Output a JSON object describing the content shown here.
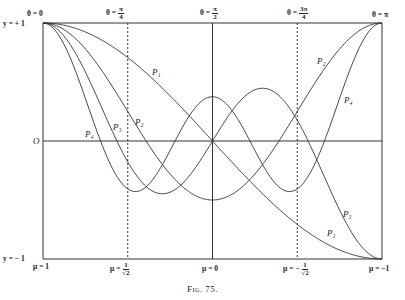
{
  "figure": {
    "caption": "Fig. 75."
  },
  "labels": {
    "theta_0": "θ = 0",
    "theta_pi4_prefix": "θ =",
    "theta_pi4_num": "π",
    "theta_pi4_den": "4",
    "theta_pi2_prefix": "θ =",
    "theta_pi2_num": "π",
    "theta_pi2_den": "2",
    "theta_3pi4_prefix": "θ =",
    "theta_3pi4_num": "3π",
    "theta_3pi4_den": "4",
    "theta_pi": "θ = π",
    "y_plus1": "y = + 1",
    "y_zero": "O",
    "y_minus1": "y = − 1",
    "mu_1": "μ = 1",
    "mu_inv_sqrt2_prefix": "μ =",
    "mu_inv_sqrt2_num": "1",
    "mu_inv_sqrt2_den": "√2",
    "mu_0": "μ = 0",
    "mu_neg_inv_sqrt2_prefix": "μ = −",
    "mu_neg_inv_sqrt2_num": "1",
    "mu_neg_inv_sqrt2_den": "√2",
    "mu_neg1": "μ = −1",
    "P1": "P₁",
    "P2": "P₂",
    "P3": "P₃",
    "P4": "P₄"
  },
  "chart_data": {
    "type": "line",
    "title": "Fig. 75.",
    "xlabel": "θ (top) / μ = cos θ (bottom)",
    "ylabel": "y",
    "xlim": [
      0,
      3.14159
    ],
    "ylim": [
      -1,
      1
    ],
    "x_ticks_top": [
      "θ = 0",
      "θ = π/4",
      "θ = π/2",
      "θ = 3π/4",
      "θ = π"
    ],
    "x_ticks_bottom": [
      "μ = 1",
      "μ = 1/√2",
      "μ = 0",
      "μ = −1/√2",
      "μ = −1"
    ],
    "y_ticks": [
      "y = +1",
      "O",
      "y = −1"
    ],
    "grid": false,
    "legend": "inline labels P1, P2, P3, P4",
    "x": [
      0,
      0.3927,
      0.7854,
      1.1781,
      1.5708,
      1.9635,
      2.3562,
      2.7489,
      3.1416
    ],
    "series": [
      {
        "name": "P1",
        "values": [
          1.0,
          0.924,
          0.707,
          0.383,
          0.0,
          -0.383,
          -0.707,
          -0.924,
          -1.0
        ]
      },
      {
        "name": "P2",
        "values": [
          1.0,
          0.78,
          0.25,
          -0.28,
          -0.5,
          -0.28,
          0.25,
          0.78,
          1.0
        ]
      },
      {
        "name": "P3",
        "values": [
          1.0,
          0.574,
          -0.177,
          -0.442,
          0.0,
          0.442,
          0.177,
          -0.574,
          -1.0
        ]
      },
      {
        "name": "P4",
        "values": [
          1.0,
          0.311,
          -0.406,
          -0.01,
          0.375,
          -0.01,
          -0.406,
          0.311,
          1.0
        ]
      }
    ],
    "vertical_lines": [
      {
        "at": "θ = π/4",
        "style": "dashed"
      },
      {
        "at": "θ = π/2",
        "style": "solid"
      },
      {
        "at": "θ = 3π/4",
        "style": "dashed"
      }
    ]
  }
}
